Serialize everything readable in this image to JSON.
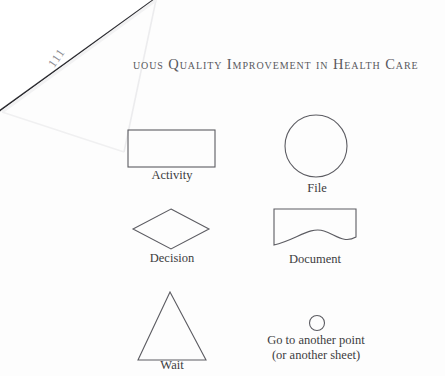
{
  "page": {
    "width": 445,
    "height": 376,
    "background_color": "#fdfdfd",
    "ink_color": "#5c5c62",
    "type": "scanned-book-page"
  },
  "header": {
    "running_head": "uous Quality Improvement in Health Care",
    "note": "left portion occluded by curled page corner",
    "style": "small-caps"
  },
  "page_corner": {
    "page_number": "111",
    "description": "curled-page-corner"
  },
  "legend": {
    "title": "Flowchart symbols",
    "symbols": [
      {
        "id": "activity",
        "label": "Activity",
        "shape": "rectangle",
        "column": "left",
        "row": 1
      },
      {
        "id": "file",
        "label": "File",
        "shape": "circle",
        "column": "right",
        "row": 1
      },
      {
        "id": "decision",
        "label": "Decision",
        "shape": "diamond",
        "column": "left",
        "row": 2
      },
      {
        "id": "document",
        "label": "Document",
        "shape": "document-wave",
        "column": "right",
        "row": 2
      },
      {
        "id": "wait",
        "label": "Wait",
        "shape": "triangle",
        "column": "left",
        "row": 3
      },
      {
        "id": "connector",
        "label_line1": "Go to another point",
        "label_line2": "(or another sheet)",
        "shape": "small-circle",
        "column": "right",
        "row": 3
      }
    ]
  }
}
